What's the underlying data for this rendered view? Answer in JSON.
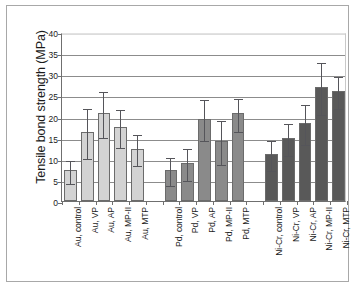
{
  "chart_data": {
    "type": "bar",
    "title": "",
    "xlabel": "",
    "ylabel": "Tensile bond strength (MPa)",
    "ylim": [
      0,
      40
    ],
    "yticks": [
      0,
      5,
      10,
      15,
      20,
      25,
      30,
      35,
      40
    ],
    "ytick_labels": [
      "0",
      "5",
      "10",
      "15",
      "20",
      "25",
      "30",
      "35",
      "40"
    ],
    "grid": true,
    "legend": "none",
    "error_bars": "standard deviation",
    "categories": [
      "Au, control",
      "Au, VP",
      "Au, AP",
      "Au, MP-II",
      "Au, MTP",
      "Pd, control",
      "Pd, VP",
      "Pd, AP",
      "Pd, MP-II",
      "Pd, MTP",
      "Ni-Cr, control",
      "Ni-Cr, VP",
      "Ni-Cr, AP",
      "Ni-Cr, MP-II",
      "Ni-Cr, MTP"
    ],
    "values": [
      7.3,
      16.3,
      20.8,
      17.5,
      12.4,
      7.4,
      8.9,
      19.5,
      14.3,
      20.8,
      11.1,
      15.0,
      18.5,
      27.0,
      26.0
    ],
    "errors": [
      2.7,
      6.0,
      5.5,
      4.6,
      3.6,
      3.3,
      3.8,
      4.8,
      5.2,
      3.9,
      3.6,
      3.8,
      4.7,
      6.1,
      3.8
    ],
    "groups": [
      {
        "name": "Au",
        "color": "#d3d3d3",
        "start_index": 0,
        "count": 5
      },
      {
        "name": "Pd",
        "color": "#8a8a8a",
        "start_index": 5,
        "count": 5
      },
      {
        "name": "Ni-Cr",
        "color": "#595959",
        "start_index": 10,
        "count": 5
      }
    ],
    "series": [
      {
        "name": "Tensile bond strength",
        "values": [
          7.3,
          16.3,
          20.8,
          17.5,
          12.4,
          7.4,
          8.9,
          19.5,
          14.3,
          20.8,
          11.1,
          15.0,
          18.5,
          27.0,
          26.0
        ]
      }
    ]
  }
}
